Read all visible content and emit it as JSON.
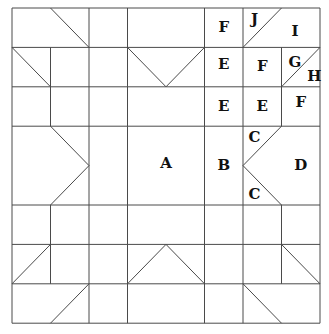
{
  "diagram": {
    "type": "quilt-block-pattern",
    "grid": {
      "cols": 8,
      "rows": 8
    },
    "line_color": "#4a4a4a",
    "label_color": "#111111",
    "labels": [
      {
        "text": "F",
        "gx": 5.5,
        "gy": 0.5
      },
      {
        "text": "J",
        "gx": 6.3,
        "gy": 0.3
      },
      {
        "text": "I",
        "gx": 7.35,
        "gy": 0.6
      },
      {
        "text": "E",
        "gx": 5.5,
        "gy": 1.45
      },
      {
        "text": "F",
        "gx": 6.5,
        "gy": 1.5
      },
      {
        "text": "G",
        "gx": 7.35,
        "gy": 1.4
      },
      {
        "text": "H",
        "gx": 7.85,
        "gy": 1.75
      },
      {
        "text": "E",
        "gx": 5.5,
        "gy": 2.5
      },
      {
        "text": "E",
        "gx": 6.5,
        "gy": 2.5
      },
      {
        "text": "F",
        "gx": 7.5,
        "gy": 2.4
      },
      {
        "text": "C",
        "gx": 6.3,
        "gy": 3.3
      },
      {
        "text": "A",
        "gx": 4.0,
        "gy": 3.95
      },
      {
        "text": "B",
        "gx": 5.5,
        "gy": 4.0
      },
      {
        "text": "D",
        "gx": 7.5,
        "gy": 4.0
      },
      {
        "text": "C",
        "gx": 6.3,
        "gy": 4.75
      }
    ]
  }
}
